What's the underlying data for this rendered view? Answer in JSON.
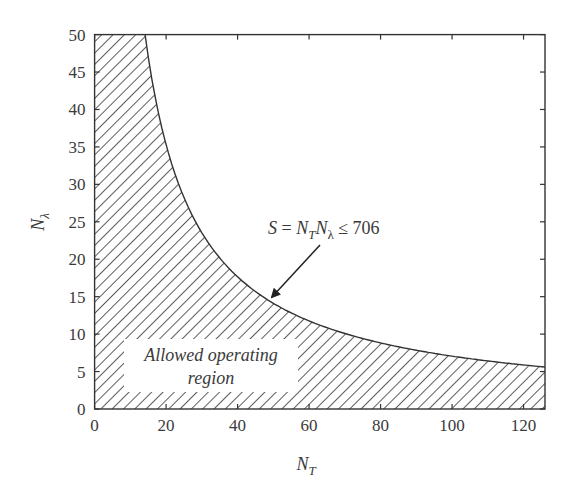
{
  "chart_data": {
    "type": "area",
    "title": "",
    "xlabel": "N_T",
    "ylabel": "N_λ",
    "xlim": [
      0,
      126
    ],
    "ylim": [
      0,
      50
    ],
    "grid": false,
    "xticks": [
      0,
      20,
      40,
      60,
      80,
      100,
      120
    ],
    "yticks": [
      0,
      5,
      10,
      15,
      20,
      25,
      30,
      35,
      40,
      45,
      50
    ],
    "curve": {
      "name": "S = N_T N_λ = 706",
      "equation": "N_λ = 706 / N_T",
      "x": [
        14.1,
        20,
        30,
        40,
        50,
        60,
        70,
        80,
        90,
        100,
        110,
        120,
        126
      ],
      "y": [
        50,
        35.3,
        23.5,
        17.7,
        14.1,
        11.8,
        10.1,
        8.8,
        7.8,
        7.1,
        6.4,
        5.9,
        5.6
      ]
    },
    "shaded_region": "N_T * N_λ <= 706 (hatched, below the curve, capped at N_λ = 50)",
    "annotations": [
      {
        "text": "S = N_T N_λ ≤ 706",
        "arrow_to": [
          50,
          14.1
        ]
      },
      {
        "text": "Allowed operating region",
        "position": "lower-left inside shaded area"
      }
    ]
  },
  "labels": {
    "xlabel_main": "N",
    "xlabel_sub": "T",
    "ylabel_main": "N",
    "ylabel_sub": "λ",
    "annotation": {
      "s": "S",
      "eq": " = ",
      "n1": "N",
      "n1_sub": "T",
      "n2": "N",
      "n2_sub": "λ",
      "rest": " ≤ 706"
    },
    "region_line1": "Allowed operating",
    "region_line2": "region"
  },
  "colors": {
    "ink": "#333333",
    "background": "#ffffff"
  }
}
